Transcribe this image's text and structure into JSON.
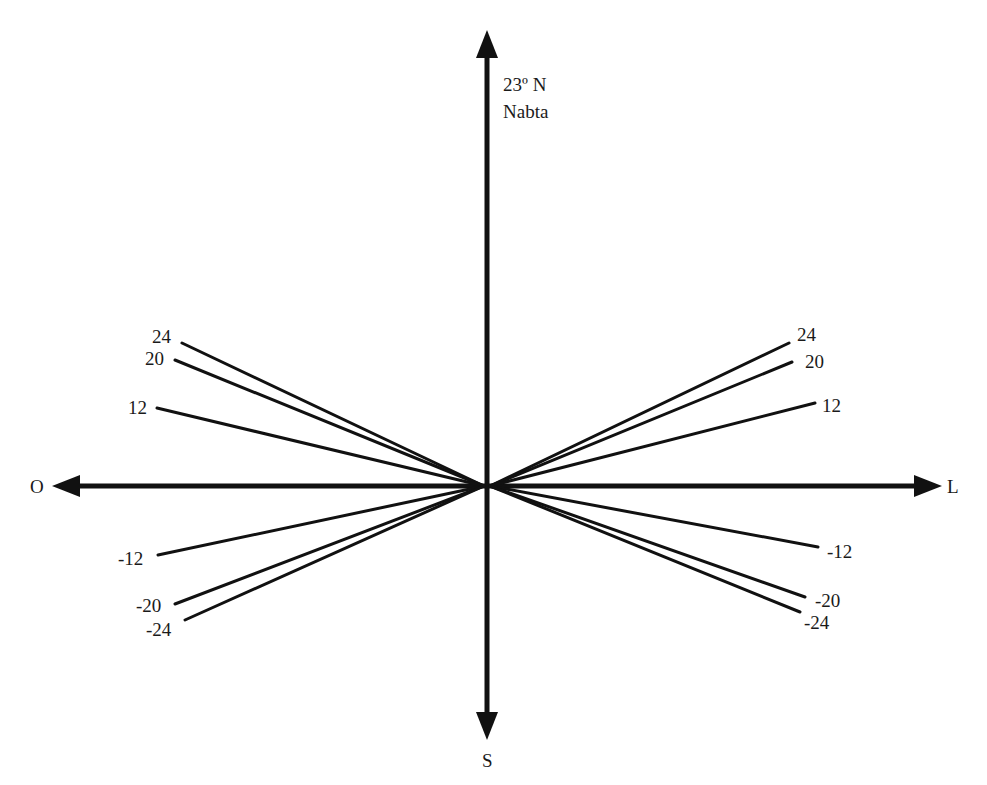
{
  "diagram": {
    "title_lines": [
      "23º N",
      "Nabta"
    ],
    "directions": {
      "north_label": "23º N",
      "south": "S",
      "west": "O",
      "east": "L"
    },
    "place": "Nabta",
    "latitude": "23º N",
    "line_color": "#111111",
    "rays": {
      "left": [
        {
          "label": "24"
        },
        {
          "label": "20"
        },
        {
          "label": "12"
        },
        {
          "label": "-12"
        },
        {
          "label": "-20"
        },
        {
          "label": "-24"
        }
      ],
      "right": [
        {
          "label": "24"
        },
        {
          "label": "20"
        },
        {
          "label": "12"
        },
        {
          "label": "-12"
        },
        {
          "label": "-20"
        },
        {
          "label": "-24"
        }
      ]
    }
  }
}
